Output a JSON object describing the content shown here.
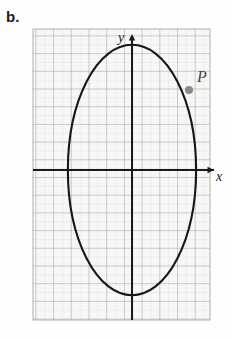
{
  "figure": {
    "label": "b.",
    "background_color": "#fefefe"
  },
  "grid": {
    "x_left": 33,
    "y_top": 29,
    "x_right": 210,
    "y_bottom": 320,
    "minor_spacing": 8.85,
    "major_spacing": 17.7,
    "minor_color": "#dcdcdc",
    "major_color": "#a8a8a8",
    "paper_color": "#f7f7f5",
    "minor_visible": true,
    "major_visible": true
  },
  "axes": {
    "origin_x": 132,
    "origin_y": 170,
    "color": "#1a1a1a",
    "line_width": 2.0,
    "x_label": "x",
    "y_label": "y",
    "x_arrow": true,
    "y_arrow": true,
    "x_axis_start": 33,
    "x_axis_end": 216,
    "y_axis_start": 320,
    "y_axis_end": 34
  },
  "chart_data": {
    "type": "scatter",
    "title": "",
    "xlabel": "x",
    "ylabel": "y",
    "curve": {
      "name": "ellipse",
      "shape": "ellipse",
      "center_x": 0,
      "center_y": 0,
      "semi_axis_x": 3.6,
      "semi_axis_y": 7.05,
      "color": "#171717",
      "line_width": 2.1
    },
    "points": [
      {
        "label": "P",
        "x": 3.2,
        "y": 4.5,
        "pixel_x": 189,
        "pixel_y": 90,
        "marker_color": "#8a8a8a",
        "marker_radius": 4.0,
        "label_color": "#4a4a4a",
        "label_offset_x": 8,
        "label_offset_y": -8
      }
    ],
    "xlim": [
      -5.6,
      4.4
    ],
    "ylim": [
      -8.5,
      8.0
    ],
    "grid": true,
    "legend": false
  }
}
